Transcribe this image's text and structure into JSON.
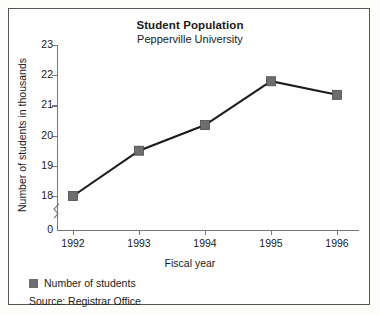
{
  "chart_data": {
    "type": "line",
    "title": "Student Population",
    "subtitle": "Pepperville University",
    "xlabel": "Fiscal year",
    "ylabel": "Number of students in thousands",
    "categories": [
      "1992",
      "1993",
      "1994",
      "1995",
      "1996"
    ],
    "values": [
      18.0,
      19.5,
      20.35,
      21.8,
      21.35
    ],
    "series": [
      {
        "name": "Number of students",
        "values": [
          18.0,
          19.5,
          20.35,
          21.8,
          21.35
        ]
      }
    ],
    "ylim": [
      18,
      23
    ],
    "yticks": [
      "0",
      "18",
      "19",
      "20",
      "21",
      "22",
      "23"
    ],
    "ytick_values": [
      0,
      18,
      19,
      20,
      21,
      22,
      23
    ],
    "axis_break": true,
    "grid": false,
    "legend_position": "bottom-left",
    "legend_entries": [
      "Number of students"
    ],
    "source": "Source: Registrar Office",
    "marker": "square",
    "colors": {
      "line": "#1c1c1c",
      "marker": "#6e6e6e",
      "axis": "#777777",
      "text": "#1a1a1a",
      "frame": "#565656",
      "background": "#ffffff"
    }
  }
}
